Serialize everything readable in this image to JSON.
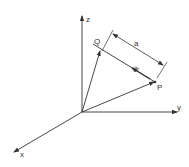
{
  "diagram": {
    "title": "",
    "axes": {
      "x_label": "x",
      "y_label": "y",
      "z_label": "z"
    },
    "points": {
      "Q_label": "Q",
      "P_label": "P"
    },
    "vector_label": "ū",
    "distance_label": "a",
    "colors": {
      "line": "#333333",
      "background": "#ffffff"
    }
  }
}
